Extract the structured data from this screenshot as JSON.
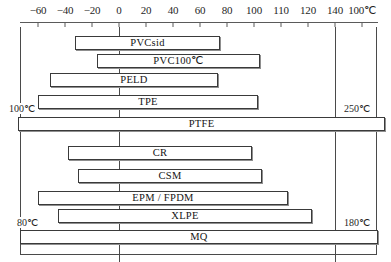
{
  "chart_data": {
    "type": "bar",
    "title": "",
    "subtitle": "",
    "xlabel": "",
    "ylabel": "",
    "unit": "℃",
    "orientation": "horizontal",
    "grid": false,
    "legend": "none",
    "axis": {
      "position": "top",
      "tick_labels": [
        "−60",
        "−40",
        "−20",
        "0",
        "20",
        "40",
        "60",
        "80",
        "100",
        "110",
        "120",
        "140",
        "100℃"
      ],
      "tick_values": [
        -60,
        -40,
        -20,
        0,
        20,
        40,
        60,
        80,
        100,
        110,
        120,
        140,
        160
      ],
      "xlim": [
        -60,
        160
      ]
    },
    "reference_lines": [
      {
        "name": "left-reference-line",
        "value": 0,
        "px": 119
      },
      {
        "name": "right-reference-line",
        "value": 120,
        "px": 335
      }
    ],
    "annotations": [
      {
        "name": "tpe-left-annotation",
        "text": "100℃",
        "side": "left",
        "row": 3
      },
      {
        "name": "ptfe-right-annotation",
        "text": "250℃",
        "side": "right",
        "row": 4
      },
      {
        "name": "xlpe-left-annotation",
        "text": "80℃",
        "side": "left",
        "row": 8
      },
      {
        "name": "xlpe-right-annotation",
        "text": "180℃",
        "side": "right",
        "row": 8
      }
    ],
    "categories": [
      "PVCsid",
      "PVC100℃",
      "PELD",
      "TPE",
      "PTFE",
      "CR",
      "CSM",
      "EPM / FPDM",
      "XLPE",
      "MQ"
    ],
    "bars": [
      {
        "label": "PVCsid",
        "start": -32,
        "end": 75,
        "px_left": 75,
        "px_right": 220,
        "px_top": 36
      },
      {
        "label": "PVC100℃",
        "start": -16,
        "end": 104,
        "px_left": 97,
        "px_right": 260,
        "px_top": 54
      },
      {
        "label": "PELD",
        "start": -51,
        "end": 73,
        "px_left": 50,
        "px_right": 218,
        "px_top": 73
      },
      {
        "label": "TPE",
        "start": -60,
        "end": 103,
        "px_left": 38,
        "px_right": 258,
        "px_top": 95
      },
      {
        "label": "PTFE",
        "start": -75,
        "end": 197,
        "px_left": 18,
        "px_right": 385,
        "px_top": 117
      },
      {
        "label": "CR",
        "start": -38,
        "end": 98,
        "px_left": 68,
        "px_right": 252,
        "px_top": 146
      },
      {
        "label": "CSM",
        "start": -30,
        "end": 106,
        "px_left": 78,
        "px_right": 262,
        "px_top": 169
      },
      {
        "label": "EPM / FPDM",
        "start": -60,
        "end": 125,
        "px_left": 38,
        "px_right": 288,
        "px_top": 191
      },
      {
        "label": "XLPE",
        "start": -45,
        "end": 143,
        "px_left": 58,
        "px_right": 312,
        "px_top": 209
      },
      {
        "label": "MQ",
        "start": -74,
        "end": 192,
        "px_left": 20,
        "px_right": 378,
        "px_top": 230
      }
    ]
  }
}
